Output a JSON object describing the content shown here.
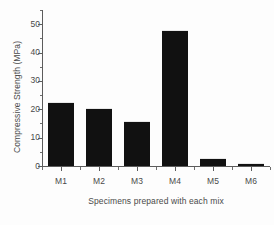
{
  "chart_data": {
    "type": "bar",
    "title": "",
    "xlabel": "Specimens prepared with each mix",
    "ylabel": "Compressive Strength (MPa)",
    "categories": [
      "M1",
      "M2",
      "M3",
      "M4",
      "M5",
      "M6"
    ],
    "values": [
      22.5,
      20.5,
      16.0,
      48.0,
      3.0,
      1.0
    ],
    "series": [
      {
        "name": "Compressive Strength",
        "values": [
          22.5,
          20.5,
          16.0,
          48.0,
          3.0,
          1.0
        ]
      }
    ],
    "ylim": [
      0,
      55
    ],
    "yticks": [
      0,
      10,
      20,
      30,
      40,
      50
    ],
    "ytick_labels": [
      "0",
      "10",
      "20",
      "30",
      "40",
      "50"
    ],
    "y_minor_tick_step": 5,
    "grid": false,
    "legend": null,
    "bar_color": "#111111",
    "axis_color": "#5c5c5c",
    "background_color": "#fdfdfd"
  }
}
